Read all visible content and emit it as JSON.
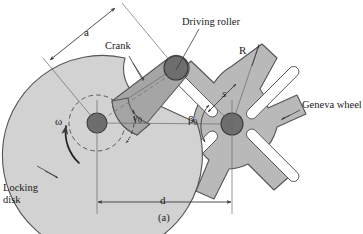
{
  "figure": {
    "caption": "(a)",
    "type": "engineering-diagram"
  },
  "labels": {
    "dimension_a": "a",
    "crank": "Crank",
    "driving_roller": "Driving roller",
    "radius_R": "R",
    "geneva_wheel": "Geneva wheel",
    "slot_s": "s",
    "angular_velocity": "ω",
    "gamma": "γ",
    "gamma_sub": "0",
    "beta": "β",
    "beta_sub": "0",
    "locking_disk_line1": "Locking",
    "locking_disk_line2": "disk",
    "center_distance_d": "d"
  },
  "parts": [
    {
      "name": "locking-disk",
      "kind": "disk-with-cutout",
      "fill": "#d2d2d2",
      "stroke": "#555555"
    },
    {
      "name": "crank-arm",
      "kind": "tapered-arm",
      "fill": "#a5a5a5",
      "stroke": "#555555"
    },
    {
      "name": "geneva-wheel",
      "kind": "maltese-cross-4-slot",
      "fill": "#b9b9b9",
      "stroke": "#555555"
    },
    {
      "name": "driving-roller",
      "kind": "pin-circle",
      "fill": "#6e6e6e",
      "stroke": "#3a3a3a"
    },
    {
      "name": "crank-hub",
      "kind": "pin-circle",
      "fill": "#6e6e6e",
      "stroke": "#3a3a3a"
    },
    {
      "name": "geneva-hub",
      "kind": "pin-circle",
      "fill": "#6e6e6e",
      "stroke": "#3a3a3a"
    },
    {
      "name": "wheel-slots",
      "kind": "radial-slots",
      "count": 4,
      "fill": "#ffffff",
      "stroke": "#555555"
    }
  ],
  "colors": {
    "background": "#ffffff",
    "locking_disk": "#d2d2d2",
    "crank": "#a5a5a5",
    "geneva_wheel": "#b9b9b9",
    "hub": "#6e6e6e",
    "slot": "#ffffff",
    "outline": "#555555",
    "leader_line": "#3d3d3d",
    "text": "#1a1a1a"
  },
  "geometry": {
    "crank_center": {
      "x": 97,
      "y": 123
    },
    "geneva_center": {
      "x": 232,
      "y": 124
    },
    "driving_roller": {
      "x": 176,
      "y": 68
    },
    "center_distance_d_px": 135,
    "crank_radius_a_px": 90,
    "geneva_outer_R_px": 58,
    "locking_disk_radius_px": 72,
    "slot_count": 4
  }
}
